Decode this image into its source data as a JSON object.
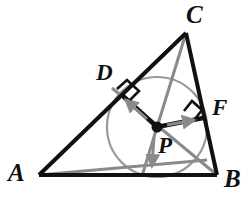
{
  "figure": {
    "canvas": {
      "width": 248,
      "height": 199
    },
    "colors": {
      "background": "#ffffff",
      "triangle_stroke": "#111111",
      "bisector_stroke": "#8a8a8a",
      "circle_stroke": "#9a9a9a",
      "radius_stroke": "#111111",
      "arrow_fill": "#8a8a8a",
      "label_color": "#111111",
      "right_angle_stroke": "#111111"
    },
    "points": {
      "A": {
        "label": "A",
        "x": 39,
        "y": 175
      },
      "B": {
        "label": "B",
        "x": 217,
        "y": 175
      },
      "C": {
        "label": "C",
        "x": 186,
        "y": 33
      },
      "D": {
        "label": "D",
        "x": 124,
        "y": 97
      },
      "F": {
        "label": "F",
        "x": 201,
        "y": 117
      },
      "P": {
        "label": "P",
        "x": 157,
        "y": 127
      },
      "E": {
        "label": "E",
        "x": 156,
        "y": 177
      }
    },
    "circle": {
      "center_x": 157,
      "center_y": 127,
      "radius": 50
    },
    "triangle_sides": [
      "AB",
      "BC",
      "CA"
    ],
    "angle_bisectors": [
      "A-P-extended",
      "B-P-extended",
      "C-P-extended"
    ],
    "radii": [
      "PD",
      "PF",
      "PE"
    ],
    "right_angles_at": [
      "D",
      "F"
    ],
    "labels": {
      "C": "C",
      "A": "A",
      "B": "B",
      "D": "D",
      "F": "F",
      "P": "P"
    }
  }
}
